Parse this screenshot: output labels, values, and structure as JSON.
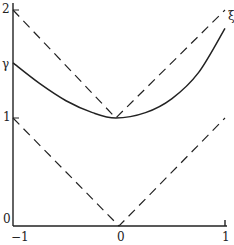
{
  "chart_data": {
    "type": "line",
    "title": "",
    "xlabel": "",
    "ylabel": "",
    "xlim": [
      -1,
      1
    ],
    "ylim": [
      0,
      2
    ],
    "grid": false,
    "x_ticks": [
      "-1",
      "0",
      "1"
    ],
    "y_ticks": [
      "0",
      "1",
      "2"
    ],
    "y_annotations": [
      {
        "label": "γ",
        "y": 1.5
      }
    ],
    "curve_annotation": {
      "label": "ξ",
      "x": 1.03,
      "y": 1.93
    },
    "series": [
      {
        "name": "ξ",
        "style": "solid",
        "x": [
          -1,
          -0.75,
          -0.5,
          -0.25,
          -0.03,
          0.25,
          0.5,
          0.75,
          1.0
        ],
        "y": [
          1.51,
          1.32,
          1.16,
          1.05,
          1.0,
          1.05,
          1.18,
          1.42,
          1.83
        ]
      },
      {
        "name": "upper-dashed-V",
        "style": "dashed",
        "x": [
          -1,
          -0.03,
          1
        ],
        "y": [
          2,
          1.0,
          2
        ]
      },
      {
        "name": "lower-dashed-V",
        "style": "dashed",
        "x": [
          -1,
          0,
          1
        ],
        "y": [
          1,
          0,
          1
        ]
      }
    ]
  },
  "labels": {
    "y2": "2",
    "gamma": "γ",
    "y1": "1",
    "y0": "0",
    "xm1": "−1",
    "x0": "0",
    "x1": "1",
    "xi": "ξ"
  }
}
